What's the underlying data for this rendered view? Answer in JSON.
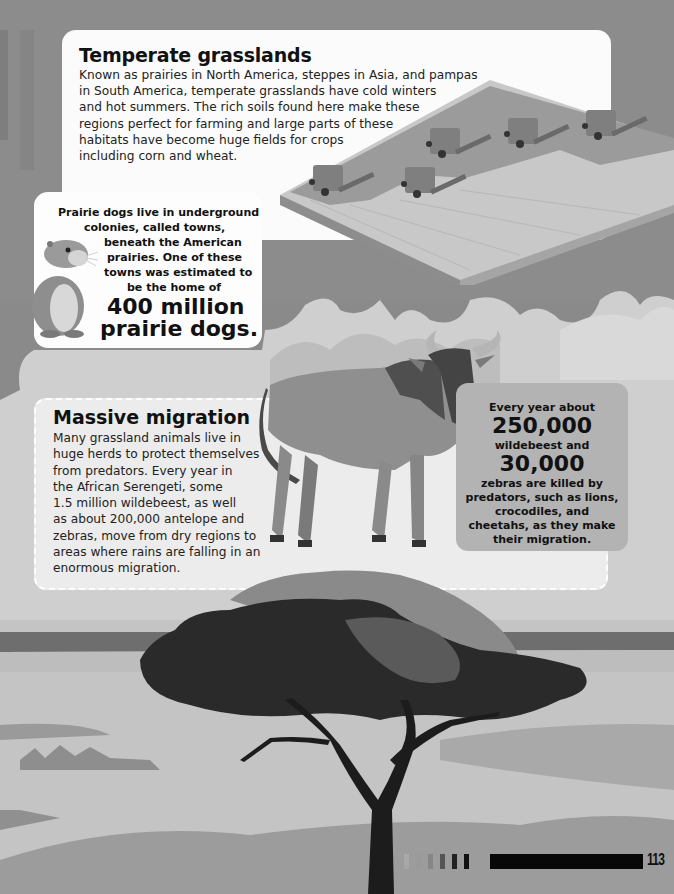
{
  "page": {
    "page_number": "113",
    "palette": {
      "background": "#8a8a8a",
      "panel_white": "#fbfbfb",
      "panel_migration": "#ececec",
      "panel_stat": "#b3b3b3",
      "text": "#111111"
    }
  },
  "temperate": {
    "title": "Temperate grasslands",
    "lines": [
      "Known as prairies in North America, steppes in Asia, and pampas",
      "in South America, temperate grasslands have cold winters",
      "and hot summers. The rich soils found here make these",
      "regions perfect for farming and large parts of these",
      "habitats have become huge fields for crops",
      "including corn and wheat."
    ],
    "illustration": "wheat-field-with-combine-harvesters"
  },
  "prairie_dog": {
    "lines": [
      "Prairie dogs live in underground",
      "colonies, called towns,",
      "beneath the American",
      "prairies. One of these",
      "towns was estimated to",
      "be the home of"
    ],
    "big_lines": [
      "400 million",
      "prairie dogs."
    ],
    "illustration": "prairie-dog"
  },
  "migration": {
    "title": "Massive migration",
    "lines": [
      "Many grassland animals live in",
      "huge herds to protect themselves",
      "from predators. Every year in",
      "the African Serengeti, some",
      "1.5 million wildebeest, as well",
      "as about 200,000 antelope and",
      "zebras, move from dry regions to",
      "areas where rains are falling in an",
      "enormous migration."
    ],
    "illustration": "wildebeest"
  },
  "stat": {
    "intro": "Every year about",
    "number1": "250,000",
    "label1": "wildebeest and",
    "number2": "30,000",
    "lines": [
      "zebras are killed by",
      "predators, such as lions,",
      "crocodiles, and",
      "cheetahs, as they make",
      "their migration."
    ]
  },
  "scene": {
    "illustration": "acacia-tree-savanna"
  }
}
